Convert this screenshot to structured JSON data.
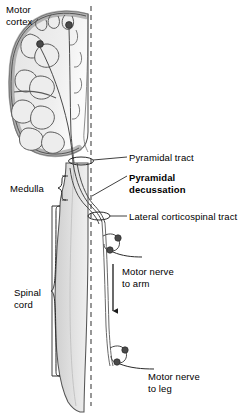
{
  "figure": {
    "background_color": "#ffffff",
    "ink_color": "#1a1a1a",
    "tissue_fill": "#d9d9d9",
    "tissue_fill_light": "#ececec",
    "cortex_ribbon": "#b9b9b9",
    "neuron_soma_color": "#4a4a4a",
    "midline_style": "dashed"
  },
  "labels": {
    "motor_cortex": "Motor\ncortex",
    "medulla": "Medulla",
    "spinal_cord": "Spinal\ncord",
    "pyramidal_tract": "Pyramidal tract",
    "pyramidal_decussation": "Pyramidal\ndecussation",
    "lateral_corticospinal_tract": "Lateral corticospinal tract",
    "motor_nerve_to_arm": "Motor nerve\nto arm",
    "motor_nerve_to_leg": "Motor nerve\nto leg"
  },
  "emphasis": {
    "pyramidal_decussation_bold": true
  },
  "structures": [
    {
      "name": "cerebral-hemisphere",
      "region": "brain",
      "side": "left"
    },
    {
      "name": "motor-cortex-neurons",
      "count": 2
    },
    {
      "name": "medulla",
      "region": "brainstem"
    },
    {
      "name": "spinal-cord",
      "region": "cord"
    },
    {
      "name": "midline",
      "region": "reference"
    },
    {
      "name": "decussation",
      "region": "medulla"
    },
    {
      "name": "lower-motor-neuron-arm",
      "level": "cervical"
    },
    {
      "name": "lower-motor-neuron-leg",
      "level": "lumbar"
    }
  ],
  "annotations": {
    "direction_arrow": "downward",
    "brackets": [
      "medulla",
      "spinal-cord"
    ]
  }
}
